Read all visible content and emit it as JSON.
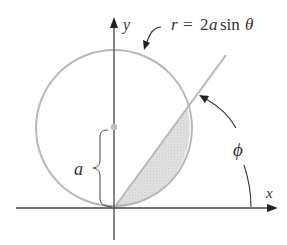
{
  "diagram": {
    "labels": {
      "y_axis": "y",
      "x_axis": "x",
      "equation_r": "r",
      "equation_eq": "=",
      "equation_coef": "2",
      "equation_a": "a",
      "equation_sin": "sin",
      "equation_theta": "θ",
      "radius_label": "a",
      "angle_label": "ϕ"
    },
    "colors": {
      "axis": "#333333",
      "circle": "#b5b5b5",
      "ray": "#b5b5b5",
      "shading": "#d9d9d9",
      "center_dot": "#bdbdbd",
      "text": "#333333"
    },
    "geometry": {
      "origin": [
        114,
        208
      ],
      "circle_center": [
        114,
        128
      ],
      "circle_radius": 80,
      "ray_angle_deg": 54
    }
  }
}
